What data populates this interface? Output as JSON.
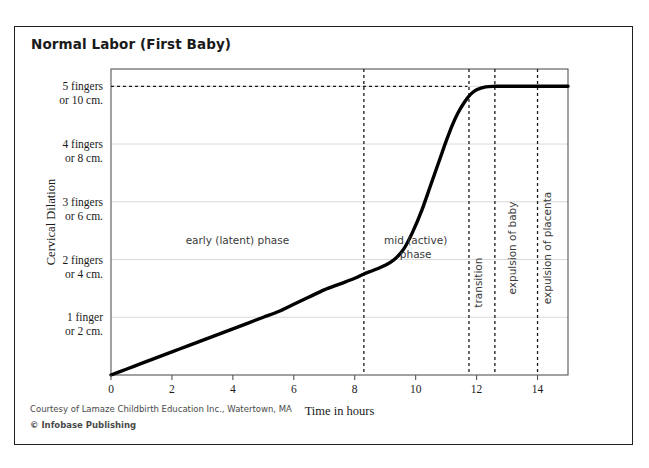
{
  "title": "Normal Labor (First Baby)",
  "credits": {
    "courtesy": "Courtesy of Lamaze Childbirth Education Inc., Watertown, MA",
    "publisher": "© Infobase Publishing"
  },
  "colors": {
    "curve": "#000000",
    "border": "#231f20",
    "grid": "#d9d9d9",
    "axis": "#555555",
    "dashed": "#1a1a1a",
    "text": "#1a1a1a",
    "background": "#ffffff"
  },
  "chart_data": {
    "type": "line",
    "title": "Normal Labor (First Baby)",
    "xlabel": "Time in hours",
    "ylabel": "Cervical Dilation",
    "xlim": [
      0,
      15
    ],
    "ylim": [
      0,
      10.6
    ],
    "grid": true,
    "legend": null,
    "xticks": [
      0,
      2,
      4,
      6,
      8,
      10,
      12,
      14
    ],
    "xticklabels": [
      "0",
      "2",
      "4",
      "6",
      "8",
      "10",
      "12",
      "14"
    ],
    "yticks": [
      2,
      4,
      6,
      8,
      10
    ],
    "yticklabels": [
      [
        "1 finger",
        "or 2 cm."
      ],
      [
        "2 fingers",
        "or 4 cm."
      ],
      [
        "3 fingers",
        "or 6 cm."
      ],
      [
        "4 fingers",
        "or 8 cm."
      ],
      [
        "5 fingers",
        "or 10 cm."
      ]
    ],
    "series": [
      {
        "name": "Cervical dilation",
        "x": [
          0.0,
          0.5,
          1.0,
          1.5,
          2.0,
          2.5,
          3.0,
          3.5,
          4.0,
          4.5,
          5.0,
          5.5,
          6.0,
          6.5,
          7.0,
          7.5,
          8.0,
          8.3,
          8.6,
          9.0,
          9.3,
          9.6,
          9.9,
          10.2,
          10.5,
          10.8,
          11.0,
          11.2,
          11.4,
          11.6,
          11.8,
          12.0,
          12.3,
          12.6,
          13.0,
          13.5,
          14.0,
          14.5,
          15.0
        ],
        "y": [
          0.0,
          0.2,
          0.4,
          0.6,
          0.8,
          1.0,
          1.2,
          1.4,
          1.6,
          1.8,
          2.0,
          2.2,
          2.45,
          2.7,
          2.95,
          3.15,
          3.35,
          3.5,
          3.62,
          3.8,
          4.0,
          4.35,
          4.95,
          5.7,
          6.6,
          7.5,
          8.1,
          8.65,
          9.1,
          9.45,
          9.72,
          9.88,
          9.98,
          10.0,
          10.0,
          10.0,
          10.0,
          10.0,
          10.0
        ]
      }
    ],
    "reference_lines": {
      "horizontal": [
        {
          "y": 10,
          "x_start": 0,
          "x_end": 11.7,
          "style": "dashed",
          "label": "full dilation"
        }
      ],
      "vertical": [
        {
          "x": 8.3,
          "style": "dashed"
        },
        {
          "x": 11.75,
          "style": "dashed"
        },
        {
          "x": 12.6,
          "style": "dashed"
        },
        {
          "x": 14.0,
          "style": "dashed"
        }
      ]
    },
    "annotations": [
      {
        "text": [
          "early (latent) phase"
        ],
        "x": 4.15,
        "y": 4.55,
        "orientation": "horizontal",
        "name": "early-latent-phase"
      },
      {
        "text": [
          "mid (active)",
          "phase"
        ],
        "x": 10.0,
        "y": 4.55,
        "orientation": "horizontal",
        "name": "mid-active-phase"
      },
      {
        "text": [
          "transition"
        ],
        "x": 12.17,
        "y": 3.2,
        "orientation": "vertical",
        "name": "transition"
      },
      {
        "text": [
          "expulsion of baby"
        ],
        "x": 13.3,
        "y": 4.4,
        "orientation": "vertical",
        "name": "expulsion-of-baby"
      },
      {
        "text": [
          "expulsion of placenta"
        ],
        "x": 14.45,
        "y": 4.4,
        "orientation": "vertical",
        "name": "expulsion-of-placenta"
      }
    ]
  }
}
